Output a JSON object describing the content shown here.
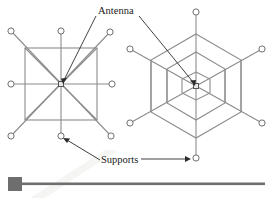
{
  "figure": {
    "caption_labels": {
      "antenna": "Antenna",
      "supports": "Supports"
    },
    "colors": {
      "structure_line": "#8c8c8c",
      "node_stroke": "#6f6f6f",
      "node_fill": "#ffffff",
      "antenna_fill": "#e9e9e9",
      "leader": "#2b2b2b",
      "rule": "#6e6e6e",
      "background": "#ffffff",
      "text": "#1a1a1a"
    },
    "left_diagram": {
      "name": "square-planar-antenna-support-layout",
      "shape": "square",
      "center": {
        "x": 61,
        "y": 84
      },
      "frame_half_size": 36,
      "spoke_count": 8,
      "support_nodes": [
        {
          "x": 11,
          "y": 31
        },
        {
          "x": 61,
          "y": 31
        },
        {
          "x": 110,
          "y": 32
        },
        {
          "x": 11,
          "y": 84
        },
        {
          "x": 112,
          "y": 84
        },
        {
          "x": 11,
          "y": 136
        },
        {
          "x": 61,
          "y": 136
        },
        {
          "x": 111,
          "y": 136
        }
      ],
      "node_radius": 3.1,
      "antenna_box_size": 5
    },
    "right_diagram": {
      "name": "hexagonal-antenna-support-layout",
      "shape": "hexagon",
      "center": {
        "x": 196,
        "y": 86
      },
      "ring_count": 3,
      "ring_radii": [
        16,
        34,
        52
      ],
      "orientation": "pointy-top",
      "spoke_count": 6,
      "support_nodes": [
        {
          "x": 196,
          "y": 12
        },
        {
          "x": 130,
          "y": 49
        },
        {
          "x": 262,
          "y": 49
        },
        {
          "x": 130,
          "y": 123
        },
        {
          "x": 262,
          "y": 123
        },
        {
          "x": 196,
          "y": 158
        }
      ],
      "node_radius": 3.1,
      "antenna_box_size": 5
    },
    "antenna_label": {
      "text": "Antenna",
      "text_x": 98,
      "text_y": 12,
      "leaders": [
        {
          "from": {
            "x": 96,
            "y": 16
          },
          "to": {
            "x": 63,
            "y": 81
          },
          "target": "left-diagram-center"
        },
        {
          "from": {
            "x": 139,
            "y": 16
          },
          "to": {
            "x": 194,
            "y": 83
          },
          "target": "right-diagram-center"
        }
      ]
    },
    "supports_label": {
      "text": "Supports",
      "text_x": 102,
      "text_y": 163,
      "leaders": [
        {
          "from": {
            "x": 100,
            "y": 160
          },
          "to": {
            "x": 64,
            "y": 139
          },
          "target": "left-diagram-bottom-node"
        },
        {
          "from": {
            "x": 142,
            "y": 159
          },
          "to": {
            "x": 190,
            "y": 159
          },
          "target": "right-diagram-bottom-node"
        }
      ]
    },
    "bottom_rule": {
      "name": "figure-divider-rule",
      "block": {
        "x": 8,
        "y": 177,
        "width": 14,
        "height": 14
      },
      "bar": {
        "x": 22,
        "y": 182,
        "width": 243,
        "height": 3
      }
    }
  }
}
